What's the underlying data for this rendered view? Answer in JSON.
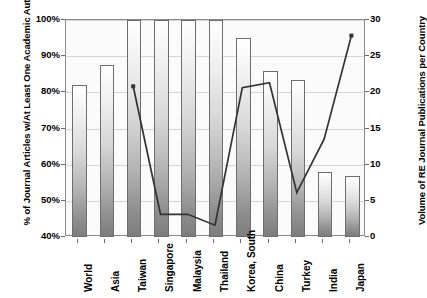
{
  "chart_data": {
    "type": "bar",
    "title": "",
    "categories": [
      "World",
      "Asia",
      "Taiwan",
      "Singapore",
      "Malaysia",
      "Thailand",
      "Korea, South",
      "China",
      "Turkey",
      "India",
      "Japan"
    ],
    "xlabel": "",
    "ylabel": "% of Journal Articles w/At Least One Academic Author",
    "y2label": "Volume of RE Journal Publications per Country",
    "ylim": [
      40,
      100
    ],
    "y2lim": [
      0,
      30
    ],
    "yticks": [
      "40%",
      "50%",
      "60%",
      "70%",
      "80%",
      "90%",
      "100%"
    ],
    "ytick_values": [
      40,
      50,
      60,
      70,
      80,
      90,
      100
    ],
    "y2ticks": [
      "0",
      "5",
      "10",
      "15",
      "20",
      "25",
      "30"
    ],
    "y2tick_values": [
      0,
      5,
      10,
      15,
      20,
      25,
      30
    ],
    "grid": true,
    "legend": "none",
    "series": [
      {
        "name": "% of Journal Articles w/At Least One Academic Author",
        "type": "bar",
        "axis": "left",
        "values": [
          82,
          87.5,
          100,
          100,
          100,
          100,
          95,
          86,
          83.5,
          58,
          57
        ]
      },
      {
        "name": "Volume of RE Journal Publications per Country",
        "type": "line",
        "axis": "right",
        "values": [
          null,
          null,
          20.7,
          3.0,
          3.0,
          1.5,
          20.5,
          21.2,
          6.0,
          13.4,
          27.7
        ]
      }
    ]
  },
  "axes": {
    "left_title": "% of Journal Articles w/At Least One Academic Author",
    "right_title": "Volume of RE Journal Publications per Country"
  }
}
